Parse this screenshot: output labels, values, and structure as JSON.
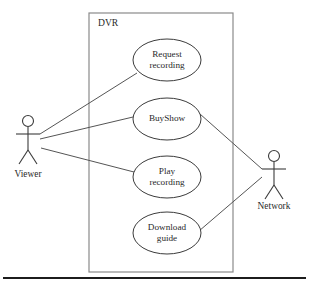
{
  "diagram": {
    "type": "uml-use-case-diagram",
    "background_color": "#ffffff",
    "line_color": "#3b3b3b",
    "text_color": "#2a2a2a"
  },
  "system_boundary": {
    "label": "DVR",
    "label_x": 98,
    "label_y": 24,
    "x": 89,
    "y": 13,
    "width": 144,
    "height": 259,
    "border_color": "#8a8a8a"
  },
  "use_cases": [
    {
      "id": "request-recording",
      "lines": [
        "Request",
        "recording"
      ],
      "cx": 167,
      "cy": 60,
      "rx": 34,
      "ry": 21
    },
    {
      "id": "buyshow",
      "lines": [
        "BuyShow"
      ],
      "cx": 167,
      "cy": 119,
      "rx": 34,
      "ry": 21
    },
    {
      "id": "play-recording",
      "lines": [
        "Play",
        "recording"
      ],
      "cx": 167,
      "cy": 177,
      "rx": 34,
      "ry": 21
    },
    {
      "id": "download-guide",
      "lines": [
        "Download",
        "guide"
      ],
      "cx": 167,
      "cy": 233,
      "rx": 34,
      "ry": 21
    }
  ],
  "actors": [
    {
      "id": "viewer",
      "label": "Viewer",
      "head_cx": 28,
      "head_cy": 121,
      "head_r": 5.5,
      "body_top": 127,
      "body_bottom": 150,
      "arm_y": 134,
      "arm_half_width": 12,
      "leg_spread": 9,
      "leg_bottom": 164,
      "label_x": 28,
      "label_y": 175
    },
    {
      "id": "network",
      "label": "Network",
      "head_cx": 274,
      "head_cy": 156,
      "head_r": 5.5,
      "body_top": 162,
      "body_bottom": 185,
      "arm_y": 169,
      "arm_half_width": 12,
      "leg_spread": 9,
      "leg_bottom": 199,
      "label_x": 274,
      "label_y": 207
    }
  ],
  "associations": [
    {
      "id": "viewer-to-request-recording",
      "from": "viewer",
      "to": "request-recording",
      "x1": 40,
      "y1": 134,
      "x2": 137,
      "y2": 73
    },
    {
      "id": "viewer-to-buyshow",
      "from": "viewer",
      "to": "buyshow",
      "x1": 40,
      "y1": 139,
      "x2": 133,
      "y2": 117
    },
    {
      "id": "viewer-to-play-recording",
      "from": "viewer",
      "to": "play-recording",
      "x1": 41,
      "y1": 148,
      "x2": 134,
      "y2": 172
    },
    {
      "id": "buyshow-to-network",
      "from": "buyshow",
      "to": "network",
      "x1": 200,
      "y1": 114,
      "x2": 262,
      "y2": 169
    },
    {
      "id": "download-guide-to-network",
      "from": "download-guide",
      "to": "network",
      "x1": 199,
      "y1": 231,
      "x2": 262,
      "y2": 177
    }
  ],
  "footer_rule": {
    "x1": 3,
    "x2": 306,
    "y": 278,
    "color": "#1c1c1c"
  }
}
